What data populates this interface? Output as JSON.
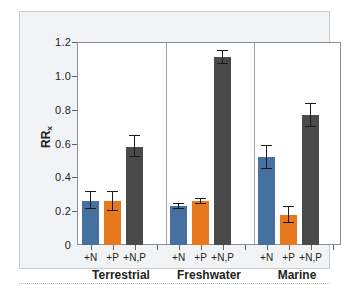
{
  "chart_data": {
    "type": "bar",
    "title": "",
    "xlabel": "",
    "ylabel": "RRx",
    "ylabel_base": "RR",
    "ylabel_sub": "x",
    "ylim": [
      0,
      1.2
    ],
    "yticks": [
      0,
      0.2,
      0.4,
      0.6,
      0.8,
      1.0,
      1.2
    ],
    "ytick_labels": [
      "0",
      "0.2",
      "0.4",
      "0.6",
      "0.8",
      "1.0",
      "1.2"
    ],
    "grid": false,
    "legend": "none",
    "categories": [
      "+N",
      "+P",
      "+N,P"
    ],
    "groups": [
      {
        "name": "Terrestrial",
        "bars": [
          {
            "category": "+N",
            "value": 0.26,
            "err_low": 0.05,
            "err_high": 0.06,
            "color": "#45709f",
            "series": "+N"
          },
          {
            "category": "+P",
            "value": 0.26,
            "err_low": 0.06,
            "err_high": 0.06,
            "color": "#e8781e",
            "series": "+P"
          },
          {
            "category": "+N,P",
            "value": 0.58,
            "err_low": 0.06,
            "err_high": 0.07,
            "color": "#4a4a4a",
            "series": "+N,P"
          }
        ]
      },
      {
        "name": "Freshwater",
        "bars": [
          {
            "category": "+N",
            "value": 0.23,
            "err_low": 0.02,
            "err_high": 0.02,
            "color": "#45709f",
            "series": "+N"
          },
          {
            "category": "+P",
            "value": 0.26,
            "err_low": 0.02,
            "err_high": 0.02,
            "color": "#e8781e",
            "series": "+P"
          },
          {
            "category": "+N,P",
            "value": 1.11,
            "err_low": 0.04,
            "err_high": 0.04,
            "color": "#4a4a4a",
            "series": "+N,P"
          }
        ]
      },
      {
        "name": "Marine",
        "bars": [
          {
            "category": "+N",
            "value": 0.52,
            "err_low": 0.07,
            "err_high": 0.07,
            "color": "#45709f",
            "series": "+N"
          },
          {
            "category": "+P",
            "value": 0.18,
            "err_low": 0.05,
            "err_high": 0.05,
            "color": "#e8781e",
            "series": "+P"
          },
          {
            "category": "+N,P",
            "value": 0.77,
            "err_low": 0.07,
            "err_high": 0.07,
            "color": "#4a4a4a",
            "series": "+N,P"
          }
        ]
      }
    ],
    "series": [
      {
        "name": "+N",
        "color": "#45709f",
        "values": [
          0.26,
          0.23,
          0.52
        ]
      },
      {
        "name": "+P",
        "color": "#e8781e",
        "values": [
          0.26,
          0.26,
          0.18
        ]
      },
      {
        "name": "+N,P",
        "color": "#4a4a4a",
        "values": [
          0.58,
          1.11,
          0.77
        ]
      }
    ],
    "colors": {
      "blue": "#45709f",
      "orange": "#e8781e",
      "gray": "#4a4a4a",
      "panel_background": "#f2f3f5",
      "panel_border": "#c6cad0",
      "axis": "#8a8f96",
      "text": "#231f20"
    }
  }
}
